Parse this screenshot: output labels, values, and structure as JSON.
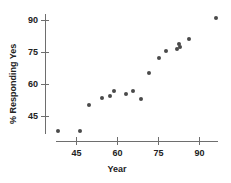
{
  "chart_data": {
    "type": "scatter",
    "title": "",
    "xlabel": "Year",
    "ylabel": "% Responding Yes",
    "xlim": [
      35,
      99
    ],
    "ylim": [
      33,
      95
    ],
    "xticks": [
      45,
      60,
      75,
      90
    ],
    "yticks": [
      45,
      60,
      75,
      90
    ],
    "xtick_labels": [
      "45",
      "60",
      "75",
      "90"
    ],
    "ytick_labels": [
      "45",
      "60",
      "75",
      "90"
    ],
    "grid": false,
    "legend": null,
    "marker": "filled-circle",
    "marker_color": "#4a4a4a",
    "points": [
      {
        "x": 38.2,
        "y": 38.4
      },
      {
        "x": 46.3,
        "y": 38.4
      },
      {
        "x": 49.6,
        "y": 50.6
      },
      {
        "x": 54.5,
        "y": 53.6
      },
      {
        "x": 57.1,
        "y": 54.5
      },
      {
        "x": 58.8,
        "y": 56.8
      },
      {
        "x": 63.2,
        "y": 55.4
      },
      {
        "x": 65.7,
        "y": 56.8
      },
      {
        "x": 68.7,
        "y": 53.2
      },
      {
        "x": 71.6,
        "y": 65.2
      },
      {
        "x": 75.2,
        "y": 72.3
      },
      {
        "x": 77.6,
        "y": 75.6
      },
      {
        "x": 81.9,
        "y": 76.6
      },
      {
        "x": 82.8,
        "y": 77.6
      },
      {
        "x": 82.6,
        "y": 79.0
      },
      {
        "x": 86.3,
        "y": 81.2
      },
      {
        "x": 96.1,
        "y": 91.3
      }
    ]
  },
  "axes": {
    "x_axis_name": "x-axis",
    "y_axis_name": "y-axis"
  }
}
